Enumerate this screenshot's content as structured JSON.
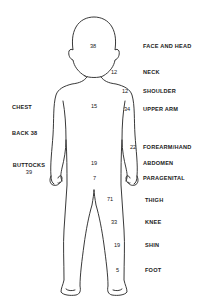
{
  "diagram": {
    "type": "body-region-map",
    "figure": "front view of child body outline",
    "right_labels": [
      {
        "id": "face-and-head",
        "label": "FACE AND HEAD",
        "value": "38"
      },
      {
        "id": "neck",
        "label": "NECK",
        "value": "12"
      },
      {
        "id": "shoulder",
        "label": "SHOULDER",
        "value": "12"
      },
      {
        "id": "upper-arm",
        "label": "UPPER ARM",
        "value": "34"
      },
      {
        "id": "forearm-hand",
        "label": "FOREARM/HAND",
        "value": "22"
      },
      {
        "id": "abdomen",
        "label": "ABDOMEN",
        "value": "19"
      },
      {
        "id": "paragenital",
        "label": "PARAGENITAL",
        "value": "7"
      },
      {
        "id": "thigh",
        "label": "THIGH",
        "value": "71"
      },
      {
        "id": "knee",
        "label": "KNEE",
        "value": "33"
      },
      {
        "id": "shin",
        "label": "SHIN",
        "value": "19"
      },
      {
        "id": "foot",
        "label": "FOOT",
        "value": "5"
      }
    ],
    "left_labels": [
      {
        "id": "chest",
        "label": "CHEST",
        "value": "15"
      },
      {
        "id": "back",
        "label": "BACK 38"
      },
      {
        "id": "buttocks",
        "label": "BUTTOCKS",
        "value": "39"
      }
    ]
  }
}
